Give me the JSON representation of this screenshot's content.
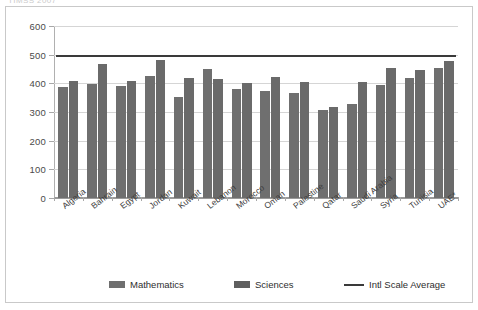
{
  "caption_fragment": "TIMSS 2007",
  "chart_data": {
    "type": "bar",
    "title": "",
    "xlabel": "",
    "ylabel": "",
    "ylim": [
      0,
      600
    ],
    "yticks": [
      0,
      100,
      200,
      300,
      400,
      500,
      600
    ],
    "grid": true,
    "legend_position": "bottom",
    "categories": [
      "Algeria",
      "Bahrain",
      "Egypt",
      "Jordan",
      "Kuwait",
      "Lebanon",
      "Morocco",
      "Oman",
      "Palestine",
      "Qatar",
      "Saudi Arabia",
      "Syria",
      "Tunisia",
      "UAE*"
    ],
    "series": [
      {
        "name": "Mathematics",
        "color": "#6f6f6f",
        "values": [
          387,
          398,
          391,
          427,
          354,
          449,
          381,
          372,
          367,
          307,
          329,
          395,
          420,
          453
        ]
      },
      {
        "name": "Sciences",
        "color": "#6a6a6a",
        "values": [
          408,
          467,
          408,
          482,
          418,
          414,
          402,
          423,
          404,
          319,
          403,
          452,
          445,
          477
        ]
      }
    ],
    "reference_line": {
      "name": "Intl Scale Average",
      "value": 500,
      "color": "#3a3a3a"
    },
    "legend": [
      {
        "label": "Mathematics",
        "swatch": "bar-light"
      },
      {
        "label": "Sciences",
        "swatch": "bar-dark"
      },
      {
        "label": "Intl Scale Average",
        "swatch": "line"
      }
    ]
  }
}
